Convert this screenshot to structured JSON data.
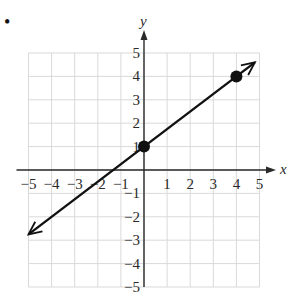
{
  "chart_data": {
    "type": "line",
    "title": "",
    "xlabel": "x",
    "ylabel": "y",
    "xlim": [
      -5,
      5
    ],
    "ylim": [
      -5,
      5
    ],
    "grid": true,
    "x_ticks": [
      -5,
      -4,
      -3,
      -2,
      -1,
      1,
      2,
      3,
      4,
      5
    ],
    "y_ticks": [
      -5,
      -4,
      -3,
      -2,
      -1,
      1,
      2,
      3,
      4,
      5
    ],
    "x_tick_labels": [
      "−5",
      "−4",
      "−3",
      "−2",
      "−1",
      "1",
      "2",
      "3",
      "4",
      "5"
    ],
    "y_tick_labels": [
      "−5",
      "−4",
      "−3",
      "−2",
      "−1",
      "1",
      "2",
      "3",
      "4",
      "5"
    ],
    "series": [
      {
        "name": "line",
        "equation": "y = (3/4)x + 1",
        "slope": 0.75,
        "intercept": 1,
        "arrows": "both",
        "extent_x": [
          -5,
          4.8
        ],
        "marked_points": [
          {
            "x": 0,
            "y": 1
          },
          {
            "x": 4,
            "y": 4
          }
        ]
      }
    ]
  },
  "style": {
    "grid_color": "#d9d9d9",
    "axis_color": "#2a2a2a",
    "line_color": "#111111",
    "point_color": "#111111"
  },
  "marker": {
    "bullet": "•"
  }
}
